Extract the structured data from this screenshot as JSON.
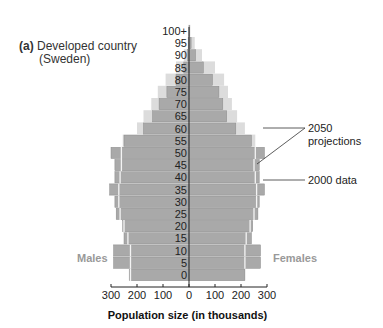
{
  "title": {
    "label": "(a)",
    "line1": "Developed country",
    "line2": "(Sweden)"
  },
  "chart_data": {
    "type": "bar",
    "orientation": "horizontal-population-pyramid",
    "title": "(a) Developed country (Sweden)",
    "xlabel": "Population size (in thousands)",
    "ylabel": "Age",
    "categories": [
      "0",
      "5",
      "10",
      "15",
      "20",
      "25",
      "30",
      "35",
      "40",
      "45",
      "50",
      "55",
      "60",
      "65",
      "70",
      "75",
      "80",
      "85",
      "90",
      "95",
      "100+"
    ],
    "x_ticks": [
      "300",
      "200",
      "100",
      "0",
      "100",
      "200",
      "300"
    ],
    "xlim": [
      -300,
      300
    ],
    "side_labels": {
      "left": "Males",
      "right": "Females"
    },
    "legend": [
      "2050 projections",
      "2000 data"
    ],
    "series": [
      {
        "name": "Males 2000 data",
        "values": [
          230,
          290,
          290,
          250,
          255,
          280,
          285,
          305,
          285,
          285,
          300,
          250,
          175,
          140,
          115,
          85,
          50,
          20,
          5,
          2,
          0
        ]
      },
      {
        "name": "Females 2000 data",
        "values": [
          215,
          275,
          275,
          240,
          245,
          265,
          270,
          290,
          270,
          270,
          290,
          240,
          180,
          145,
          130,
          115,
          90,
          55,
          25,
          8,
          3
        ]
      },
      {
        "name": "Males 2050 projections",
        "values": [
          225,
          225,
          225,
          235,
          250,
          265,
          270,
          270,
          265,
          260,
          260,
          255,
          200,
          175,
          145,
          120,
          90,
          50,
          20,
          5,
          2
        ]
      },
      {
        "name": "Females 2050 projections",
        "values": [
          215,
          215,
          215,
          220,
          235,
          250,
          260,
          260,
          255,
          250,
          255,
          255,
          215,
          185,
          165,
          150,
          135,
          100,
          50,
          22,
          5
        ]
      }
    ],
    "colors": {
      "data_2000": "#a9a9a9",
      "projection_2050": "#dcdcdc",
      "projection_line": "#f4f4f4",
      "axis": "#222222"
    },
    "grid": false
  },
  "axis": {
    "ticks": [
      "300",
      "200",
      "100",
      "0",
      "100",
      "200",
      "300"
    ],
    "label": "Population size (in thousands)"
  },
  "labels": {
    "males": "Males",
    "females": "Females"
  },
  "annotations": {
    "projections_line1": "2050",
    "projections_line2": "projections",
    "data": "2000 data"
  }
}
